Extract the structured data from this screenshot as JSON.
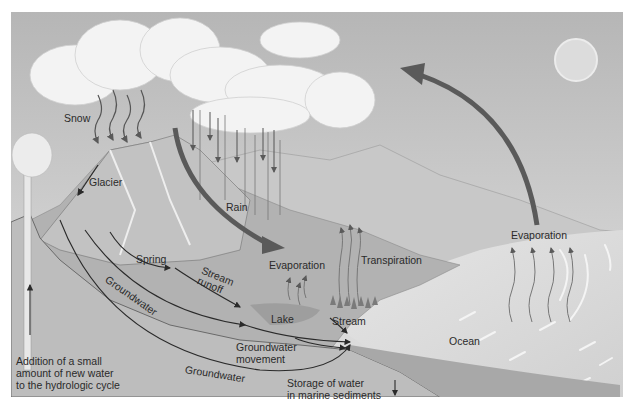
{
  "diagram": {
    "title": "Hydrologic cycle",
    "colors": {
      "sky_top": "#b9b9b9",
      "sky_bottom": "#e0e0e0",
      "sun": "#dedede",
      "cloud": "#f2f2f2",
      "mountain": "#a9a9a9",
      "ground": "#bdbdbd",
      "ocean": "#d9d9d9",
      "arrow_dark": "#555555",
      "line": "#2a2a2a"
    },
    "labels": {
      "snow": "Snow",
      "glacier": "Glacier",
      "rain": "Rain",
      "evaporation_land": "Evaporation",
      "transpiration": "Transpiration",
      "evaporation_ocean": "Evaporation",
      "spring": "Spring",
      "stream_runoff": "Stream\nrunoff",
      "groundwater_upper": "Groundwater",
      "groundwater_lower": "Groundwater",
      "lake": "Lake",
      "stream": "Stream",
      "groundwater_movement": "Groundwater\nmovement",
      "ocean": "Ocean",
      "new_water": "Addition of a small\namount of new water\nto the hydrologic cycle",
      "marine_storage": "Storage of water\nin marine sediments"
    },
    "icons": {
      "sun": "sun-icon",
      "evaporation_arrow": "curved-arrow-icon",
      "runoff_arrow": "curved-arrow-icon"
    }
  }
}
